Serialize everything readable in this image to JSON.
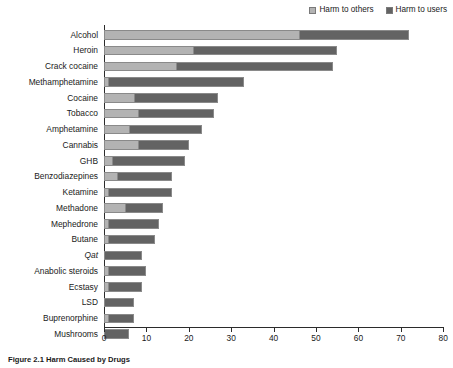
{
  "caption": "Figure 2.1  Harm Caused by Drugs",
  "legend": {
    "items": [
      {
        "label": "Harm to others",
        "color": "#b3b3b3",
        "key": "others"
      },
      {
        "label": "Harm to users",
        "color": "#636363",
        "key": "users"
      }
    ]
  },
  "axis": {
    "ticks": [
      "0",
      "10",
      "20",
      "30",
      "40",
      "50",
      "60",
      "70",
      "80"
    ]
  },
  "chart_data": {
    "type": "bar",
    "orientation": "horizontal",
    "stacked": true,
    "title": "Figure 2.1  Harm Caused by Drugs",
    "xlabel": "",
    "ylabel": "",
    "xlim": [
      0,
      80
    ],
    "xticks": [
      0,
      10,
      20,
      30,
      40,
      50,
      60,
      70,
      80
    ],
    "grid": false,
    "legend_position": "top-right",
    "categories": [
      "Alcohol",
      "Heroin",
      "Crack cocaine",
      "Methamphetamine",
      "Cocaine",
      "Tobacco",
      "Amphetamine",
      "Cannabis",
      "GHB",
      "Benzodiazepines",
      "Ketamine",
      "Methadone",
      "Mephedrone",
      "Butane",
      "Qat",
      "Anabolic steroids",
      "Ecstasy",
      "LSD",
      "Buprenorphine",
      "Mushrooms"
    ],
    "series": [
      {
        "name": "Harm to others",
        "color": "#b3b3b3",
        "values": [
          46,
          21,
          17,
          1,
          7,
          8,
          6,
          8,
          2,
          3,
          1,
          5,
          1,
          1,
          0,
          1,
          1,
          0,
          1,
          0
        ]
      },
      {
        "name": "Harm to users",
        "color": "#636363",
        "values": [
          26,
          34,
          37,
          32,
          20,
          18,
          17,
          12,
          17,
          13,
          15,
          9,
          12,
          11,
          9,
          9,
          8,
          7,
          6,
          6
        ]
      }
    ],
    "totals": [
      72,
      55,
      54,
      33,
      27,
      26,
      23,
      20,
      19,
      16,
      16,
      14,
      13,
      12,
      9,
      10,
      9,
      7,
      7,
      6
    ]
  },
  "style": {
    "px_per_unit": 4.24,
    "axis_color": "#2b2b2b",
    "bar_outline": "#8a8a8a"
  }
}
